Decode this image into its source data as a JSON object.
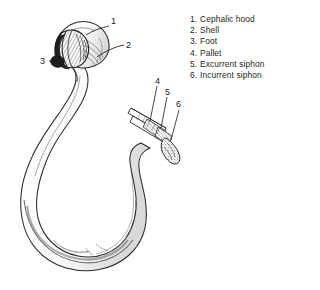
{
  "figure": {
    "background_color": "#ffffff",
    "ink_color": "#231f20",
    "legend": {
      "items": [
        {
          "num": "1.",
          "label": "Cephalic hood"
        },
        {
          "num": "2.",
          "label": "Shell"
        },
        {
          "num": "3.",
          "label": "Foot"
        },
        {
          "num": "4.",
          "label": "Pallet"
        },
        {
          "num": "5.",
          "label": "Excurrent siphon"
        },
        {
          "num": "6.",
          "label": "Incurrent siphon"
        }
      ]
    },
    "callouts": [
      {
        "id": "1",
        "text": "1",
        "x": 111,
        "y": 16
      },
      {
        "id": "2",
        "text": "2",
        "x": 126,
        "y": 40
      },
      {
        "id": "3",
        "text": "3",
        "x": 40,
        "y": 56
      },
      {
        "id": "4",
        "text": "4",
        "x": 155,
        "y": 76
      },
      {
        "id": "5",
        "text": "5",
        "x": 165,
        "y": 87
      },
      {
        "id": "6",
        "text": "6",
        "x": 176,
        "y": 99
      }
    ]
  }
}
